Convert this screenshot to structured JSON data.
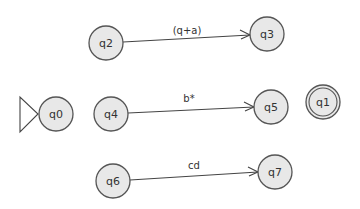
{
  "diagram": {
    "type": "finite-automaton",
    "colors": {
      "node_fill": "#e8e8e8",
      "node_stroke": "#555555",
      "edge": "#444444",
      "background": "#ffffff"
    },
    "start_state": "q0",
    "accepting_states": [
      "q1"
    ],
    "nodes": [
      {
        "id": "q0",
        "label": "q0",
        "x": 56,
        "y": 114,
        "start": true,
        "accepting": false
      },
      {
        "id": "q1",
        "label": "q1",
        "x": 323,
        "y": 102,
        "start": false,
        "accepting": true
      },
      {
        "id": "q2",
        "label": "q2",
        "x": 106,
        "y": 43,
        "start": false,
        "accepting": false
      },
      {
        "id": "q3",
        "label": "q3",
        "x": 267,
        "y": 34,
        "start": false,
        "accepting": false
      },
      {
        "id": "q4",
        "label": "q4",
        "x": 111,
        "y": 114,
        "start": false,
        "accepting": false
      },
      {
        "id": "q5",
        "label": "q5",
        "x": 271,
        "y": 107,
        "start": false,
        "accepting": false
      },
      {
        "id": "q6",
        "label": "q6",
        "x": 113,
        "y": 181,
        "start": false,
        "accepting": false
      },
      {
        "id": "q7",
        "label": "q7",
        "x": 275,
        "y": 172,
        "start": false,
        "accepting": false
      }
    ],
    "edges": [
      {
        "from": "q2",
        "to": "q3",
        "label": "(q+a)"
      },
      {
        "from": "q4",
        "to": "q5",
        "label": "b*"
      },
      {
        "from": "q6",
        "to": "q7",
        "label": "cd"
      }
    ]
  }
}
